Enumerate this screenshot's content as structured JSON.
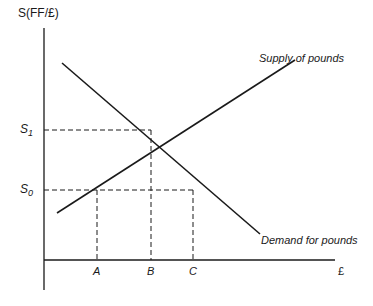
{
  "diagram": {
    "y_axis_label": "S(FF/£)",
    "x_axis_label": "£",
    "curves": {
      "supply": {
        "label": "Supply of pounds",
        "from": [
          57,
          213
        ],
        "to": [
          295,
          60
        ]
      },
      "demand": {
        "label": "Demand for pounds",
        "from": [
          62,
          63
        ],
        "to": [
          260,
          234
        ]
      }
    },
    "price_levels": [
      {
        "symbol": "S",
        "subscript": "1",
        "y": 130
      },
      {
        "symbol": "S",
        "subscript": "0",
        "y": 190
      }
    ],
    "quantity_ticks": [
      {
        "label": "A",
        "x": 97
      },
      {
        "label": "B",
        "x": 151
      },
      {
        "label": "C",
        "x": 193
      }
    ],
    "equilibrium": {
      "x": 151,
      "y": 130
    },
    "colors": {
      "line": "#1a1a1a",
      "background": "#ffffff"
    }
  }
}
